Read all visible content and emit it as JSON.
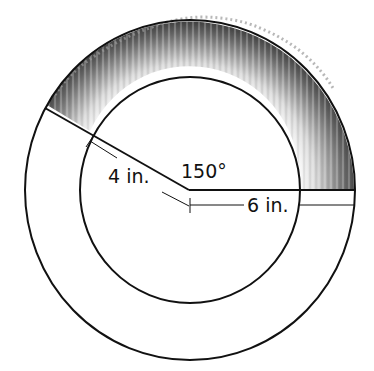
{
  "diagram": {
    "central_angle_label": "150°",
    "inner_radius_label": "4 in.",
    "outer_radius_label": "6 in.",
    "central_angle_degrees": 150,
    "inner_radius_in": 4,
    "outer_radius_in": 6,
    "shaded_region": "textured grass-like band between inner and outer circle spanning 150°",
    "colors": {
      "stroke": "#111111",
      "background": "#ffffff",
      "shade_dark": "#4a4a4a",
      "shade_light": "#d9d9d9"
    }
  }
}
